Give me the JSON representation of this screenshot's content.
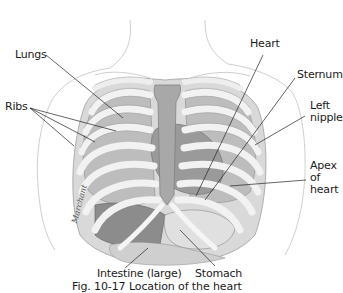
{
  "figure": {
    "caption": "Fig. 10-17 Location of the heart",
    "signature": "Marchant",
    "labels": {
      "lungs": "Lungs",
      "ribs": "Ribs",
      "heart": "Heart",
      "sternum": "Sternum",
      "left_nipple": "Left\nnipple",
      "apex_of_heart": "Apex\nof\nheart",
      "intestine_large": "Intestine (large)",
      "stomach": "Stomach"
    },
    "colors": {
      "background": "#ffffff",
      "skin_outline": "#c9c9c9",
      "rib": "#e8e8e8",
      "rib_outline": "#9a9a9a",
      "lung": "#b8b8b8",
      "lung_dark": "#8f8f8f",
      "sternum": "#a9a9a9",
      "organ_dark": "#6d6d6d",
      "leader_line": "#222222",
      "text": "#1a1a1a"
    }
  }
}
